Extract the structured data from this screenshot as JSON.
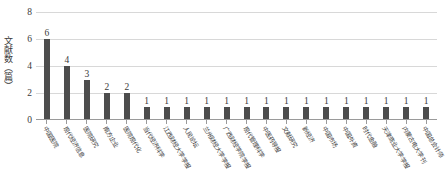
{
  "chart_data": {
    "type": "bar",
    "title": "",
    "xlabel": "",
    "ylabel": "文献数（篇）",
    "ylim": [
      0,
      8
    ],
    "yticks": [
      0,
      2,
      4,
      6,
      8
    ],
    "grid": true,
    "legend": "none",
    "bar_color": "#4d4d4d",
    "categories": [
      "中国医院",
      "现代经济信息",
      "医院研究",
      "南方企业",
      "医院现代化",
      "当代经济科学",
      "江西财经大学学报",
      "人民论坛",
      "兰州财经大学学报",
      "广西财经学院学报",
      "现代管理科学",
      "中医药导报",
      "文献研究",
      "新经济",
      "中国市场",
      "中国外资",
      "时代金融",
      "天津商业大学学报",
      "内蒙古电大学刊",
      "中国总会计师"
    ],
    "values": [
      6,
      4,
      3,
      2,
      2,
      1,
      1,
      1,
      1,
      1,
      1,
      1,
      1,
      1,
      1,
      1,
      1,
      1,
      1,
      1
    ],
    "data_labels": [
      "6",
      "4",
      "3",
      "2",
      "2",
      "1",
      "1",
      "1",
      "1",
      "1",
      "1",
      "1",
      "1",
      "1",
      "1",
      "1",
      "1",
      "1",
      "1",
      "1"
    ]
  },
  "axis": {
    "y_tick_labels": [
      "0",
      "2",
      "4",
      "6",
      "8"
    ]
  }
}
